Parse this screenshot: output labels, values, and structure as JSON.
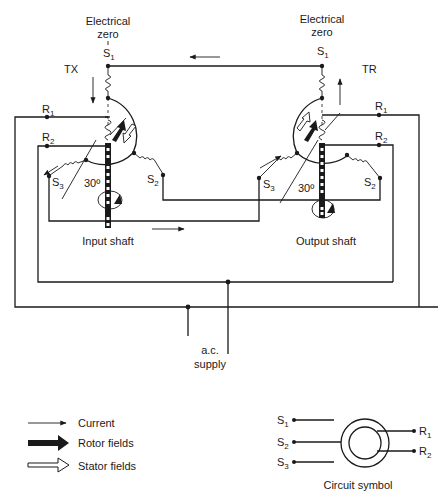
{
  "labels": {
    "tx_zero_line1": "Electrical",
    "tx_zero_line2": "zero",
    "tr_zero_line1": "Electrical",
    "tr_zero_line2": "zero",
    "tx": "TX",
    "tr": "TR",
    "input_shaft": "Input shaft",
    "output_shaft": "Output shaft",
    "ac_line1": "a.c.",
    "ac_line2": "supply",
    "angle_tx": "30º",
    "angle_tr": "30º",
    "tx_terminals": {
      "s1": "S",
      "s1_sub": "1",
      "s2": "S",
      "s2_sub": "2",
      "s3": "S",
      "s3_sub": "3",
      "r1": "R",
      "r1_sub": "1",
      "r2": "R",
      "r2_sub": "2"
    },
    "tr_terminals": {
      "s1": "S",
      "s1_sub": "1",
      "s2": "S",
      "s2_sub": "2",
      "s3": "S",
      "s3_sub": "3",
      "r1": "R",
      "r1_sub": "1",
      "r2": "R",
      "r2_sub": "2"
    }
  },
  "legend": {
    "items": [
      {
        "icon": "thin-arrow-icon",
        "label": "Current"
      },
      {
        "icon": "solid-arrow-icon",
        "label": "Rotor fields"
      },
      {
        "icon": "hollow-arrow-icon",
        "label": "Stator fields"
      }
    ]
  },
  "circuit_symbol": {
    "caption": "Circuit symbol",
    "stator": [
      {
        "label": "S",
        "sub": "1"
      },
      {
        "label": "S",
        "sub": "2"
      },
      {
        "label": "S",
        "sub": "3"
      }
    ],
    "rotor": [
      {
        "label": "R",
        "sub": "1"
      },
      {
        "label": "R",
        "sub": "2"
      }
    ]
  },
  "colors": {
    "ink": "#1a1a1a",
    "background": "#ffffff"
  }
}
